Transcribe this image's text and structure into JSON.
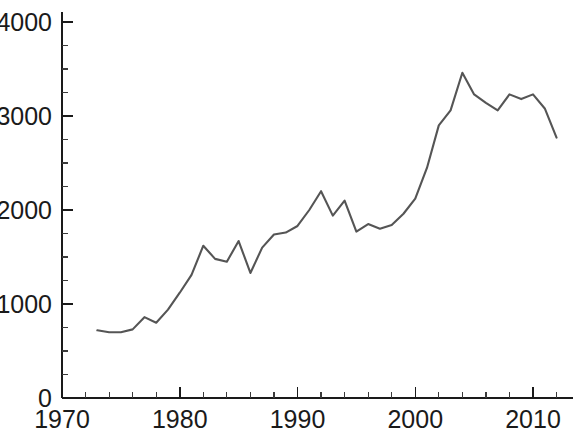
{
  "chart_data": {
    "type": "line",
    "title": "",
    "subtitle": "",
    "xlabel": "",
    "ylabel": "",
    "xlim": [
      1970,
      2013
    ],
    "ylim": [
      0,
      4000
    ],
    "grid": false,
    "legend": null,
    "x_ticks_major": [
      1970,
      1980,
      1990,
      2000,
      2010
    ],
    "x_tick_labels": [
      "1970",
      "1980",
      "1990",
      "2000",
      "2010"
    ],
    "x_ticks_minor_step": 2,
    "y_ticks_major": [
      0,
      1000,
      2000,
      3000,
      4000
    ],
    "y_tick_labels": [
      "0",
      "1000",
      "2000",
      "3000",
      "4000"
    ],
    "y_ticks_minor_step": 250,
    "line_color": "#555555",
    "axis_color": "#1a1a1a",
    "background_color": "#ffffff",
    "series": [
      {
        "name": "series-1",
        "x": [
          1973,
          1974,
          1975,
          1976,
          1977,
          1978,
          1979,
          1980,
          1981,
          1982,
          1983,
          1984,
          1985,
          1986,
          1987,
          1988,
          1989,
          1990,
          1991,
          1992,
          1993,
          1994,
          1995,
          1996,
          1997,
          1998,
          1999,
          2000,
          2001,
          2002,
          2003,
          2004,
          2005,
          2006,
          2007,
          2008,
          2009,
          2010,
          2011,
          2012
        ],
        "y": [
          720,
          700,
          700,
          730,
          860,
          800,
          940,
          1120,
          1310,
          1620,
          1480,
          1450,
          1670,
          1330,
          1600,
          1740,
          1760,
          1830,
          2000,
          2200,
          1940,
          2100,
          1770,
          1850,
          1800,
          1840,
          1960,
          2120,
          2450,
          2900,
          3060,
          3460,
          3230,
          3140,
          3060,
          3230,
          3180,
          3230,
          3080,
          2770
        ]
      }
    ]
  },
  "axes": {
    "y_tick_values": [
      "4000",
      "3000",
      "2000",
      "1000",
      "0"
    ],
    "x_tick_values": [
      "1970",
      "1980",
      "1990",
      "2000",
      "2010"
    ]
  }
}
